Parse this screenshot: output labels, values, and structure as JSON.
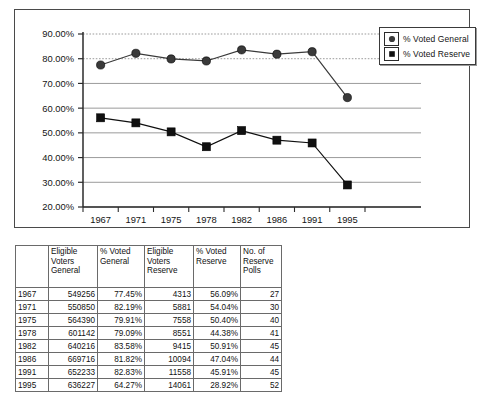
{
  "chart_data": {
    "type": "line",
    "title": "",
    "xlabel": "",
    "ylabel": "",
    "x": [
      "1967",
      "1971",
      "1975",
      "1978",
      "1982",
      "1986",
      "1991",
      "1995"
    ],
    "ylim": [
      20,
      90
    ],
    "ytick_labels": [
      "90.00%",
      "80.00%",
      "70.00%",
      "60.00%",
      "50.00%",
      "40.00%",
      "30.00%",
      "20.00%"
    ],
    "ytick_values": [
      90,
      80,
      70,
      60,
      50,
      40,
      30,
      20
    ],
    "grid": true,
    "legend_position": "top-right",
    "series": [
      {
        "name": "% Voted General",
        "marker": "circle",
        "values": [
          77.45,
          82.19,
          79.91,
          79.09,
          83.58,
          81.82,
          82.83,
          64.27
        ]
      },
      {
        "name": "% Voted Reserve",
        "marker": "square",
        "values": [
          56.09,
          54.04,
          50.4,
          44.38,
          50.91,
          47.04,
          45.91,
          28.92
        ]
      }
    ]
  },
  "legend": {
    "items": [
      {
        "label": "% Voted General",
        "marker": "circle"
      },
      {
        "label": "% Voted Reserve",
        "marker": "square"
      }
    ]
  },
  "table": {
    "corner_header": "",
    "headers": [
      "Eligible Voters General",
      "% Voted General",
      "Eligible Voters Reserve",
      "% Voted Reserve",
      "No. of Reserve Polls"
    ],
    "rows": [
      {
        "year": "1967",
        "eligible_general": "549256",
        "pct_general": "77.45%",
        "eligible_reserve": "4313",
        "pct_reserve": "56.09%",
        "polls": "27"
      },
      {
        "year": "1971",
        "eligible_general": "550850",
        "pct_general": "82.19%",
        "eligible_reserve": "5881",
        "pct_reserve": "54.04%",
        "polls": "30"
      },
      {
        "year": "1975",
        "eligible_general": "564390",
        "pct_general": "79.91%",
        "eligible_reserve": "7558",
        "pct_reserve": "50.40%",
        "polls": "40"
      },
      {
        "year": "1978",
        "eligible_general": "601142",
        "pct_general": "79.09%",
        "eligible_reserve": "8551",
        "pct_reserve": "44.38%",
        "polls": "41"
      },
      {
        "year": "1982",
        "eligible_general": "640216",
        "pct_general": "83.58%",
        "eligible_reserve": "9415",
        "pct_reserve": "50.91%",
        "polls": "45"
      },
      {
        "year": "1986",
        "eligible_general": "669716",
        "pct_general": "81.82%",
        "eligible_reserve": "10094",
        "pct_reserve": "47.04%",
        "polls": "44"
      },
      {
        "year": "1991",
        "eligible_general": "652233",
        "pct_general": "82.83%",
        "eligible_reserve": "11558",
        "pct_reserve": "45.91%",
        "polls": "45"
      },
      {
        "year": "1995",
        "eligible_general": "636227",
        "pct_general": "64.27%",
        "eligible_reserve": "14061",
        "pct_reserve": "28.92%",
        "polls": "52"
      }
    ]
  },
  "colors": {
    "series_general": "#3a3a3a",
    "series_reserve": "#101010",
    "grid": "#9b9b9b",
    "axis": "#2b2b2b",
    "frame": "#4a4a4a"
  }
}
